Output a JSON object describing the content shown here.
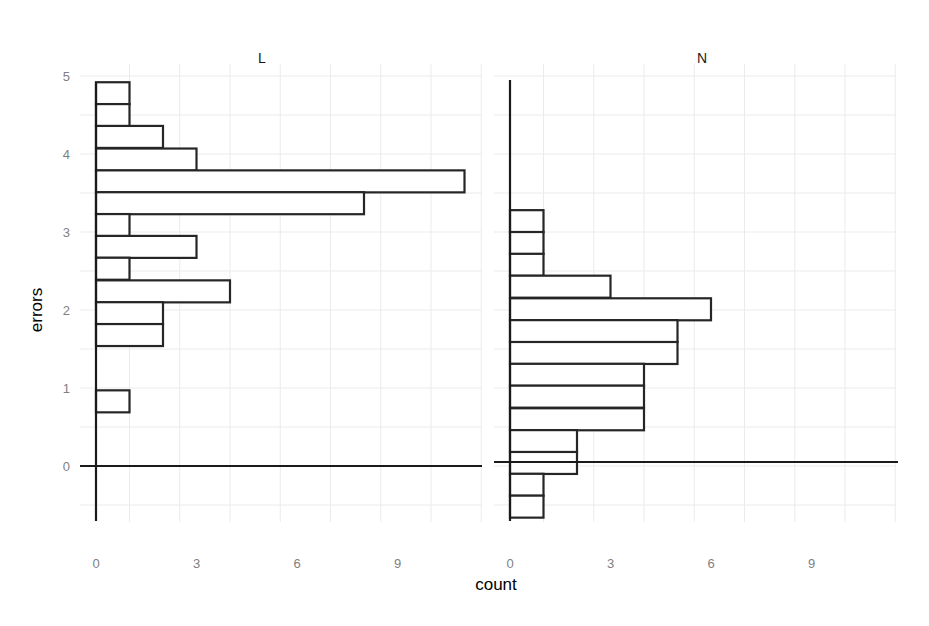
{
  "chart_data": {
    "type": "bar",
    "orientation": "horizontal histogram",
    "facet_variable": "panel",
    "xlabel": "count",
    "ylabel": "errors",
    "x_ticks": [
      0,
      3,
      6,
      9
    ],
    "y_ticks": [
      0,
      1,
      2,
      3,
      4,
      5
    ],
    "grid": true,
    "legend": "none",
    "binwidth": 0.282,
    "panels": [
      {
        "label": "L",
        "xlim": [
          0,
          11.5
        ],
        "bins_top_to_bottom": [
          {
            "y_top": 4.92,
            "count": 1
          },
          {
            "y_top": 4.64,
            "count": 1
          },
          {
            "y_top": 4.36,
            "count": 2
          },
          {
            "y_top": 4.07,
            "count": 3
          },
          {
            "y_top": 3.79,
            "count": 11
          },
          {
            "y_top": 3.51,
            "count": 8
          },
          {
            "y_top": 3.23,
            "count": 1
          },
          {
            "y_top": 2.95,
            "count": 3
          },
          {
            "y_top": 2.67,
            "count": 1
          },
          {
            "y_top": 2.38,
            "count": 4
          },
          {
            "y_top": 2.1,
            "count": 2
          },
          {
            "y_top": 1.82,
            "count": 2
          },
          {
            "y_top": 0.97,
            "count": 1
          }
        ]
      },
      {
        "label": "N",
        "xlim": [
          0,
          11.5
        ],
        "bins_top_to_bottom": [
          {
            "y_top": 3.28,
            "count": 1
          },
          {
            "y_top": 3.0,
            "count": 1
          },
          {
            "y_top": 2.72,
            "count": 1
          },
          {
            "y_top": 2.44,
            "count": 3
          },
          {
            "y_top": 2.15,
            "count": 6
          },
          {
            "y_top": 1.87,
            "count": 5
          },
          {
            "y_top": 1.59,
            "count": 5
          },
          {
            "y_top": 1.31,
            "count": 4
          },
          {
            "y_top": 1.03,
            "count": 4
          },
          {
            "y_top": 0.74,
            "count": 4
          },
          {
            "y_top": 0.46,
            "count": 2
          },
          {
            "y_top": 0.18,
            "count": 2
          },
          {
            "y_top": -0.1,
            "count": 1
          },
          {
            "y_top": -0.38,
            "count": 1
          }
        ]
      }
    ]
  },
  "labels": {
    "xlabel": "count",
    "ylabel": "errors",
    "panel_L": "L",
    "panel_N": "N"
  },
  "colors": {
    "bar_fill": "#ffffff",
    "bar_stroke": "#262626",
    "grid": "#ebebeb",
    "tick_text": "#7f7f7f"
  }
}
